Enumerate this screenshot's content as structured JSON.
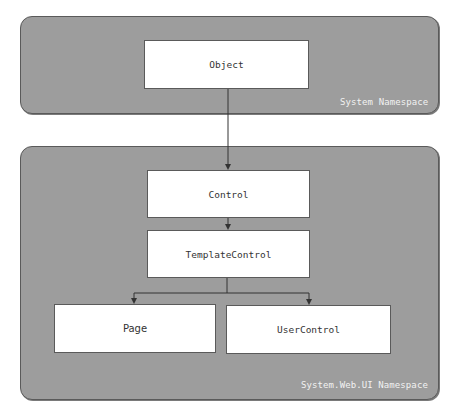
{
  "diagram": {
    "type": "class-hierarchy",
    "panels": [
      {
        "id": "system",
        "label": "System Namespace"
      },
      {
        "id": "system-web-ui",
        "label": "System.Web.UI Namespace"
      }
    ],
    "nodes": {
      "object": "Object",
      "control": "Control",
      "template_control": "TemplateControl",
      "page": "Page",
      "user_control": "UserControl"
    },
    "edges": [
      {
        "from": "Object",
        "to": "Control"
      },
      {
        "from": "Control",
        "to": "TemplateControl"
      },
      {
        "from": "TemplateControl",
        "to": "Page"
      },
      {
        "from": "TemplateControl",
        "to": "UserControl"
      }
    ],
    "colors": {
      "panel_fill": "#9d9d9d",
      "panel_border": "#5a5a5a",
      "node_fill": "#ffffff",
      "label_text": "#f2f2f2",
      "node_text": "#333333",
      "connector": "#333333"
    }
  }
}
